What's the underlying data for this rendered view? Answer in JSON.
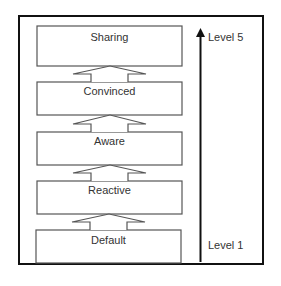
{
  "diagram": {
    "type": "maturity-levels",
    "stages": [
      {
        "label": "Sharing",
        "level": 5
      },
      {
        "label": "Convinced",
        "level": 4
      },
      {
        "label": "Aware",
        "level": 3
      },
      {
        "label": "Reactive",
        "level": 2
      },
      {
        "label": "Default",
        "level": 1
      }
    ],
    "axis": {
      "top_label": "Level 5",
      "bottom_label": "Level 1",
      "direction": "up"
    },
    "colors": {
      "stroke": "#555555",
      "frame": "#111111",
      "arrow": "#111111"
    }
  }
}
